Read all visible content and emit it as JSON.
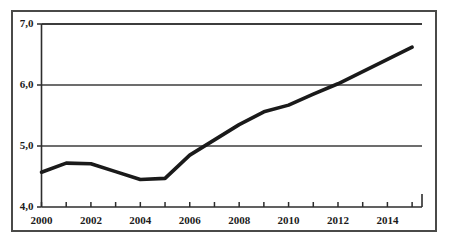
{
  "figure": {
    "has_outer_frame": true,
    "background_color": "#ffffff",
    "frame_color": "#4a4a48"
  },
  "chart_data": {
    "type": "line",
    "title": "",
    "subtitle": "",
    "xlabel": "",
    "ylabel": "",
    "x": [
      2000,
      2001,
      2002,
      2003,
      2004,
      2005,
      2006,
      2007,
      2008,
      2009,
      2010,
      2011,
      2012,
      2013,
      2014,
      2015
    ],
    "values": [
      4.57,
      4.72,
      4.71,
      4.58,
      4.45,
      4.47,
      4.85,
      5.1,
      5.35,
      5.56,
      5.67,
      5.85,
      6.02,
      6.22,
      6.42,
      6.62
    ],
    "series": [
      {
        "name": "",
        "values": [
          4.57,
          4.72,
          4.71,
          4.58,
          4.45,
          4.47,
          4.85,
          5.1,
          5.35,
          5.56,
          5.67,
          5.85,
          6.02,
          6.22,
          6.42,
          6.62
        ],
        "color": "#1a1a1a",
        "line_width": 3.6,
        "markers": false
      }
    ],
    "xlim": [
      2000,
      2015.4
    ],
    "ylim": [
      4.0,
      7.0
    ],
    "y_ticks": [
      4.0,
      5.0,
      6.0,
      7.0
    ],
    "y_tick_labels": [
      "4,0",
      "5,0",
      "6,0",
      "7,0"
    ],
    "x_ticks": [
      2000,
      2001,
      2002,
      2003,
      2004,
      2005,
      2006,
      2007,
      2008,
      2009,
      2010,
      2011,
      2012,
      2013,
      2014,
      2015
    ],
    "x_tick_labels_shown": [
      "2000",
      "2002",
      "2004",
      "2006",
      "2008",
      "2010",
      "2012",
      "2014"
    ],
    "x_tick_labels_shown_values": [
      2000,
      2002,
      2004,
      2006,
      2008,
      2010,
      2012,
      2014
    ],
    "grid": {
      "horizontal": true,
      "vertical": false,
      "lines_at": [
        5.0,
        6.0,
        7.0
      ],
      "color": "#3c3c3c"
    },
    "legend": {
      "visible": false,
      "position": "none",
      "entries": []
    },
    "decimal_separator": ","
  },
  "ytick_labels": [
    {
      "text": "7,0",
      "value": 7.0
    },
    {
      "text": "6,0",
      "value": 6.0
    },
    {
      "text": "5,0",
      "value": 5.0
    },
    {
      "text": "4,0",
      "value": 4.0
    }
  ],
  "xtick_labels": [
    {
      "text": "2000",
      "value": 2000
    },
    {
      "text": "2002",
      "value": 2002
    },
    {
      "text": "2004",
      "value": 2004
    },
    {
      "text": "2006",
      "value": 2006
    },
    {
      "text": "2008",
      "value": 2008
    },
    {
      "text": "2010",
      "value": 2010
    },
    {
      "text": "2012",
      "value": 2012
    },
    {
      "text": "2014",
      "value": 2014
    }
  ]
}
